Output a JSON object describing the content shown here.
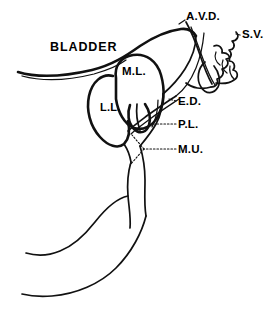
{
  "figure": {
    "kind": "anatomical-line-diagram",
    "background_color": "#ffffff",
    "line_color": "#111111",
    "width": 277,
    "height": 314
  },
  "labels": {
    "bladder": {
      "text": "BLADDER",
      "x": 50,
      "y": 41
    },
    "ampulla_vas": {
      "text": "A.V.D.",
      "x": 186,
      "y": 11
    },
    "seminal_vesicle": {
      "text": "S.V.",
      "x": 242,
      "y": 29
    },
    "middle_lobe": {
      "text": "M.L.",
      "x": 122,
      "y": 66
    },
    "lateral_lobe": {
      "text": "L.L.",
      "x": 100,
      "y": 102
    },
    "ejaculatory_duct": {
      "text": "E.D.",
      "x": 178,
      "y": 96
    },
    "posterior_lobe": {
      "text": "P.L.",
      "x": 178,
      "y": 119
    },
    "membranous_urethra": {
      "text": "M.U.",
      "x": 178,
      "y": 144
    }
  },
  "legend_expansions": {
    "A.V.D.": "Ampulla of vas deferens",
    "S.V.": "Seminal vesicle",
    "M.L.": "Middle lobe",
    "L.L.": "Lateral lobe",
    "E.D.": "Ejaculatory duct",
    "P.L.": "Posterior lobe",
    "M.U.": "Membranous urethra"
  }
}
